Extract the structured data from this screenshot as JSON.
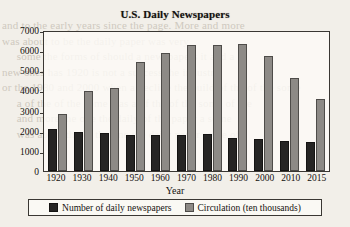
{
  "chart_data": {
    "type": "bar",
    "title": "U.S. Daily Newspapers",
    "xlabel": "Year",
    "ylabel": "",
    "ylim": [
      0,
      7000
    ],
    "yticks": [
      0,
      1000,
      2000,
      3000,
      4000,
      5000,
      6000,
      7000
    ],
    "grid": false,
    "legend_position": "bottom",
    "categories": [
      "1920",
      "1930",
      "1940",
      "1950",
      "1960",
      "1970",
      "1980",
      "1990",
      "2000",
      "2010",
      "2015"
    ],
    "series": [
      {
        "name": "Number of daily newspapers",
        "color": "#262524",
        "values": [
          2100,
          1960,
          1910,
          1800,
          1790,
          1800,
          1830,
          1650,
          1590,
          1480,
          1440
        ]
      },
      {
        "name": "Circulation (ten thousands)",
        "color": "#8d8a86",
        "values": [
          2810,
          3950,
          4120,
          5390,
          5880,
          6250,
          6250,
          6300,
          5690,
          4640,
          3580
        ]
      }
    ]
  },
  "legend": {
    "items": [
      {
        "label": "Number of daily newspapers",
        "swatch": "dark-square-icon"
      },
      {
        "label": "Circulation (ten thousands)",
        "swatch": "gray-square-icon"
      }
    ]
  },
  "background_text": "and to the early years since the page. More and more\nwas about to be the daily paper was very\n     some the forms of should a newspapers it and a\nnew ones has 1920 is not a success the industry\nor the 1980 and 2000 when a decline the build of the of the some\n     a of the of the some was a of the of the some of the\n     and more the one the daily of the paper a some\n     was about the of the one the daily paper some of"
}
